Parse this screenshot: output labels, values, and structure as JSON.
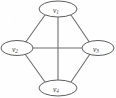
{
  "figure": {
    "kind": "graph-diagram",
    "background_color": "#fefefe",
    "edge_color": "#6e6e70",
    "node_stroke_color": "#5d5d60",
    "node_fill_color": "#ffffff",
    "label_color": "#3a3a3c"
  },
  "nodes": [
    {
      "id": "v1",
      "base": "v",
      "sub": "1",
      "label": "v1",
      "cx": 58,
      "cy": 9,
      "rx": 19,
      "ry": 8
    },
    {
      "id": "v2",
      "base": "v",
      "sub": "2",
      "label": "v2",
      "cx": 17,
      "cy": 48,
      "rx": 16,
      "ry": 7.5
    },
    {
      "id": "v3",
      "base": "v",
      "sub": "3",
      "label": "v3",
      "cx": 98,
      "cy": 48,
      "rx": 16,
      "ry": 7.5
    },
    {
      "id": "v4",
      "base": "v",
      "sub": "4",
      "label": "v4",
      "cx": 58,
      "cy": 88,
      "rx": 19,
      "ry": 8
    }
  ],
  "edges": [
    {
      "from": "v1",
      "to": "v2",
      "x1": 45,
      "y1": 15,
      "x2": 25,
      "y2": 43
    },
    {
      "from": "v1",
      "to": "v3",
      "x1": 71,
      "y1": 15,
      "x2": 90,
      "y2": 43
    },
    {
      "from": "v1",
      "to": "v4",
      "x1": 58,
      "y1": 17,
      "x2": 58,
      "y2": 80
    },
    {
      "from": "v2",
      "to": "v3",
      "x1": 33,
      "y1": 48,
      "x2": 82,
      "y2": 48
    },
    {
      "from": "v2",
      "to": "v4",
      "x1": 25,
      "y1": 54,
      "x2": 45,
      "y2": 82
    },
    {
      "from": "v3",
      "to": "v4",
      "x1": 90,
      "y1": 54,
      "x2": 71,
      "y2": 82
    }
  ]
}
